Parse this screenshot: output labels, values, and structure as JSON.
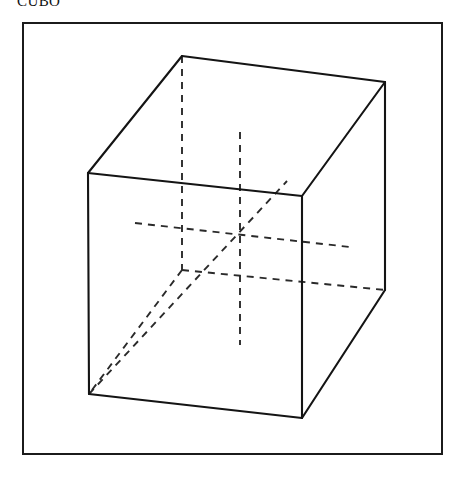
{
  "caption": {
    "text": "CUBO"
  },
  "figure": {
    "name": "cube-line-drawing",
    "frame": {
      "x": 22,
      "y": 22,
      "width": 421,
      "height": 433,
      "border_color": "#1b1b1b",
      "border_width": 2,
      "background": "#ffffff"
    },
    "style": {
      "solid_edge_color": "#141414",
      "hidden_edge_color": "#2a2a2a",
      "solid_edge_width": 2.1,
      "hidden_edge_width": 1.9,
      "hidden_dash_pattern": "7 6"
    },
    "vertices": {
      "front_top_left": [
        88,
        173
      ],
      "front_top_right": [
        302,
        196
      ],
      "front_bottom_left": [
        89,
        394
      ],
      "front_bottom_right": [
        302,
        418
      ],
      "right_top_back": [
        385,
        82
      ],
      "right_bottom_back": [
        385,
        290
      ],
      "back_top_left": [
        182,
        56
      ],
      "back_bottom_left": [
        182,
        270
      ]
    },
    "solid_edges": [
      {
        "name": "front-face-top",
        "from": "front_top_left",
        "to": "front_top_right"
      },
      {
        "name": "front-face-left",
        "from": "front_top_left",
        "to": "front_bottom_left"
      },
      {
        "name": "front-face-right",
        "from": "front_top_right",
        "to": "front_bottom_right"
      },
      {
        "name": "front-face-bottom",
        "from": "front_bottom_left",
        "to": "front_bottom_right"
      },
      {
        "name": "top-face-back-left",
        "from": "front_top_left",
        "to": "back_top_left"
      },
      {
        "name": "top-face-back-right",
        "from": "back_top_left",
        "to": "right_top_back"
      },
      {
        "name": "top-face-right",
        "from": "right_top_back",
        "to": "front_top_right"
      },
      {
        "name": "right-face-vertical",
        "from": "right_top_back",
        "to": "right_bottom_back"
      },
      {
        "name": "right-face-bottom",
        "from": "right_bottom_back",
        "to": "front_bottom_right"
      }
    ],
    "hidden_edges": [
      {
        "name": "back-left-vertical",
        "from": "back_top_left",
        "to": "back_bottom_left"
      },
      {
        "name": "back-bottom-left-to-front",
        "from": "back_bottom_left",
        "to": "front_bottom_left"
      },
      {
        "name": "back-bottom-right",
        "from": "back_bottom_left",
        "to": "right_bottom_back"
      }
    ],
    "axes": [
      {
        "name": "vertical-axis",
        "from": [
          240,
          132
        ],
        "to": [
          240,
          345
        ]
      },
      {
        "name": "horizontal-axis",
        "from": [
          135,
          223
        ],
        "to": [
          350,
          247
        ]
      },
      {
        "name": "depth-diagonal-axis",
        "from": [
          89,
          394
        ],
        "to": [
          287,
          181
        ]
      }
    ],
    "center_point": [
      240,
      238
    ]
  }
}
